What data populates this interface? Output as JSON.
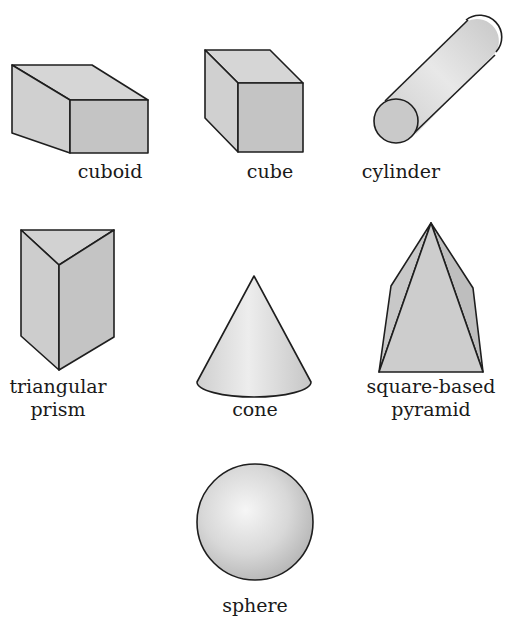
{
  "colors": {
    "outline": "#1e1e1e",
    "face_light": "#d9d9d9",
    "face_mid": "#c9c9c9",
    "face_dark": "#bcbcbc",
    "background": "#ffffff"
  },
  "shapes": [
    {
      "id": "cuboid",
      "label": "cuboid"
    },
    {
      "id": "cube",
      "label": "cube"
    },
    {
      "id": "cylinder",
      "label": "cylinder"
    },
    {
      "id": "triangular-prism",
      "label_line1": "triangular",
      "label_line2": "prism"
    },
    {
      "id": "cone",
      "label": "cone"
    },
    {
      "id": "square-based-pyramid",
      "label_line1": "square-based",
      "label_line2": "pyramid"
    },
    {
      "id": "sphere",
      "label": "sphere"
    }
  ]
}
